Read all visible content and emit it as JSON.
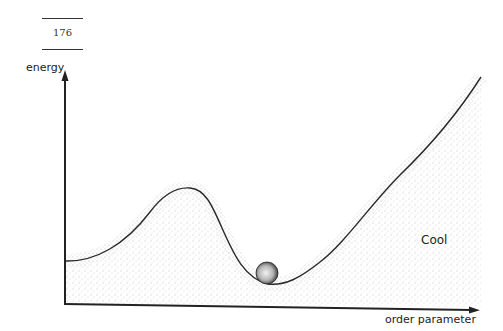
{
  "page": {
    "number": "176"
  },
  "diagram": {
    "y_axis_label": "energy",
    "x_axis_label": "order parameter",
    "state_label": "Cool",
    "curve_description": "Energy curve with a local maximum at left and a global minimum with a ball resting at the bottom, rising steeply to the right",
    "ball": "ball-in-minimum",
    "colors": {
      "line": "#222222",
      "fill_stipple": "#9a9a9a",
      "background": "#ffffff"
    }
  }
}
